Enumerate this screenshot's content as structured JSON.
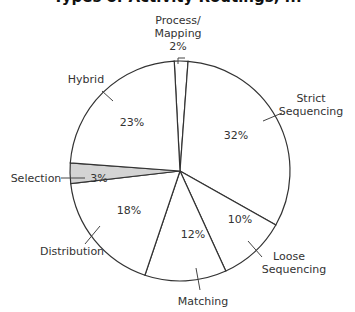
{
  "title": "Types of Activity Routings, ...",
  "chart_data": {
    "type": "pie",
    "title": "Types of Activity Routings",
    "slices": [
      {
        "label": "Process/ Mapping",
        "value": 2,
        "pct": "2%",
        "fill": "#ffffff"
      },
      {
        "label": "Strict Sequencing",
        "value": 32,
        "pct": "32%",
        "fill": "#ffffff"
      },
      {
        "label": "Loose Sequencing",
        "value": 10,
        "pct": "10%",
        "fill": "#ffffff"
      },
      {
        "label": "Matching",
        "value": 12,
        "pct": "12%",
        "fill": "#ffffff"
      },
      {
        "label": "Distribution",
        "value": 18,
        "pct": "18%",
        "fill": "#ffffff"
      },
      {
        "label": "Selection",
        "value": 3,
        "pct": "3%",
        "fill": "#d4d4d4"
      },
      {
        "label": "Hybrid",
        "value": 23,
        "pct": "23%",
        "fill": "#ffffff"
      }
    ],
    "labels": {
      "process_line1": "Process/",
      "process_line2": "Mapping",
      "process_pct": "2%",
      "strict_line1": "Strict",
      "strict_line2": "Sequencing",
      "strict_pct": "32%",
      "loose_line1": "Loose",
      "loose_line2": "Sequencing",
      "loose_pct": "10%",
      "matching": "Matching",
      "matching_pct": "12%",
      "distribution": "Distribution",
      "distribution_pct": "18%",
      "selection": "Selection",
      "selection_pct": "3%",
      "hybrid": "Hybrid",
      "hybrid_pct": "23%"
    },
    "legend": "none (callout labels)",
    "start_angle_deg": 0,
    "direction": "clockwise"
  }
}
